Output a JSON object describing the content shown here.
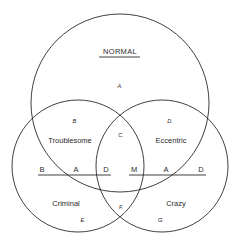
{
  "diagram": {
    "type": "venn",
    "title": "NORMAL",
    "circles": [
      {
        "name": "normal",
        "cx": 120,
        "cy": 103,
        "r": 89
      },
      {
        "name": "left",
        "cx": 78,
        "cy": 166,
        "r": 66
      },
      {
        "name": "right",
        "cx": 162,
        "cy": 166,
        "r": 66
      }
    ],
    "categories": {
      "troublesome": "Troublesome",
      "eccentric": "Eccentric",
      "criminal": "Criminal",
      "crazy": "Crazy"
    },
    "regions": {
      "a": "A.",
      "b": "B.",
      "c": "C.",
      "d": "D.",
      "e": "E.",
      "f": "F.",
      "g": "G."
    },
    "left_axis": {
      "labels": [
        "B",
        "A",
        "D"
      ]
    },
    "right_axis": {
      "labels": [
        "M",
        "A",
        "D"
      ]
    },
    "stroke_color": "#2a2a2a"
  }
}
